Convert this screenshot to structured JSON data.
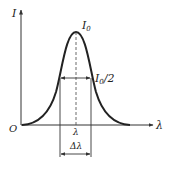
{
  "diagram": {
    "labels": {
      "y_axis": "I",
      "x_axis": "λ",
      "origin": "O",
      "peak": "I",
      "peak_sub": "0",
      "half_max": "I",
      "half_max_sub": "0",
      "half_max_suffix": "/2",
      "center": "λ",
      "width": "Δλ"
    },
    "colors": {
      "curve": "#222222",
      "axes": "#333333",
      "background": "#ffffff"
    }
  }
}
